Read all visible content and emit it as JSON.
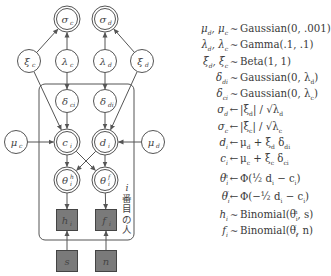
{
  "diagram": {
    "plate_label": [
      "i",
      "番",
      "目",
      "の",
      "人"
    ],
    "colors": {
      "stroke": "#555555",
      "observed_fill": "#7a7a7a",
      "background": "#ffffff"
    },
    "nodes": [
      {
        "id": "sigma_c",
        "symbol": "σ",
        "sub": "c",
        "type": "deterministic",
        "x": 67,
        "y": 19
      },
      {
        "id": "sigma_d",
        "symbol": "σ",
        "sub": "d",
        "type": "deterministic",
        "x": 105,
        "y": 19
      },
      {
        "id": "xi_c",
        "symbol": "ξ",
        "sub": "c",
        "type": "stochastic",
        "x": 29,
        "y": 61
      },
      {
        "id": "lambda_c",
        "symbol": "λ",
        "sub": "c",
        "type": "stochastic",
        "x": 67,
        "y": 61
      },
      {
        "id": "lambda_d",
        "symbol": "λ",
        "sub": "d",
        "type": "stochastic",
        "x": 105,
        "y": 61
      },
      {
        "id": "xi_d",
        "symbol": "ξ",
        "sub": "d",
        "type": "stochastic",
        "x": 142,
        "y": 61
      },
      {
        "id": "delta_c",
        "symbol": "δ",
        "sub": "ci",
        "type": "stochastic",
        "x": 67,
        "y": 101
      },
      {
        "id": "delta_d",
        "symbol": "δ",
        "sub": "di",
        "type": "stochastic",
        "x": 105,
        "y": 101
      },
      {
        "id": "mu_c",
        "symbol": "μ",
        "sub": "c",
        "type": "stochastic",
        "x": 16,
        "y": 142
      },
      {
        "id": "c_i",
        "symbol": "c",
        "sub": "i",
        "type": "deterministic",
        "x": 67,
        "y": 142
      },
      {
        "id": "d_i",
        "symbol": "d",
        "sub": "i",
        "type": "deterministic",
        "x": 105,
        "y": 142
      },
      {
        "id": "mu_d",
        "symbol": "μ",
        "sub": "d",
        "type": "stochastic",
        "x": 153,
        "y": 142
      },
      {
        "id": "theta_h",
        "symbol": "θ",
        "sub": "i",
        "sup": "h",
        "type": "deterministic",
        "x": 67,
        "y": 180
      },
      {
        "id": "theta_f",
        "symbol": "θ",
        "sub": "i",
        "sup": "f",
        "type": "deterministic",
        "x": 105,
        "y": 180
      },
      {
        "id": "h_i",
        "symbol": "h",
        "sub": "i",
        "type": "observed",
        "x": 67,
        "y": 220
      },
      {
        "id": "f_i",
        "symbol": "f",
        "sub": "i",
        "type": "observed",
        "x": 106,
        "y": 220
      },
      {
        "id": "s",
        "symbol": "s",
        "sub": "",
        "type": "observed",
        "x": 67,
        "y": 261
      },
      {
        "id": "n",
        "symbol": "n",
        "sub": "",
        "type": "observed",
        "x": 106,
        "y": 261
      }
    ],
    "edges": [
      [
        "xi_c",
        "sigma_c"
      ],
      [
        "lambda_c",
        "sigma_c"
      ],
      [
        "lambda_d",
        "sigma_d"
      ],
      [
        "xi_d",
        "sigma_d"
      ],
      [
        "lambda_c",
        "delta_c"
      ],
      [
        "lambda_d",
        "delta_d"
      ],
      [
        "xi_c",
        "c_i"
      ],
      [
        "xi_d",
        "d_i"
      ],
      [
        "delta_c",
        "c_i"
      ],
      [
        "delta_d",
        "d_i"
      ],
      [
        "mu_c",
        "c_i"
      ],
      [
        "mu_d",
        "d_i"
      ],
      [
        "c_i",
        "theta_h"
      ],
      [
        "c_i",
        "theta_f"
      ],
      [
        "d_i",
        "theta_h"
      ],
      [
        "d_i",
        "theta_f"
      ],
      [
        "theta_h",
        "h_i"
      ],
      [
        "theta_f",
        "f_i"
      ],
      [
        "s",
        "h_i"
      ],
      [
        "n",
        "f_i"
      ]
    ]
  },
  "equations": [
    {
      "lhs": "μ_d, μ_c",
      "op": "∼",
      "rhs": "Gaussian(0, .001)"
    },
    {
      "lhs": "λ_d, λ_c",
      "op": "∼",
      "rhs": "Gamma(.1, .1)"
    },
    {
      "lhs": "ξ_d, ξ_c",
      "op": "∼",
      "rhs": "Beta(1, 1)"
    },
    {
      "lhs": "δ_di",
      "op": "∼",
      "rhs": "Gaussian(0, λ_d)"
    },
    {
      "lhs": "δ_ci",
      "op": "∼",
      "rhs": "Gaussian(0, λ_c)"
    },
    {
      "lhs": "σ_d",
      "op": "←",
      "rhs": "|ξ_d| / √λ_d"
    },
    {
      "lhs": "σ_c",
      "op": "←",
      "rhs": "|ξ_c| / √λ_c"
    },
    {
      "lhs": "d_i",
      "op": "←",
      "rhs": "μ_d + ξ_d δ_di"
    },
    {
      "lhs": "c_i",
      "op": "←",
      "rhs": "μ_c + ξ_c δ_ci"
    },
    {
      "lhs": "θ_i^h",
      "op": "←",
      "rhs": "Φ(½ d_i − c_i)"
    },
    {
      "lhs": "θ_i^f",
      "op": "←",
      "rhs": "Φ(−½ d_i − c_i)"
    },
    {
      "lhs": "h_i",
      "op": "∼",
      "rhs": "Binomial(θ_i^h, s)"
    },
    {
      "lhs": "f_i",
      "op": "∼",
      "rhs": "Binomial(θ_i^f, n)"
    }
  ]
}
